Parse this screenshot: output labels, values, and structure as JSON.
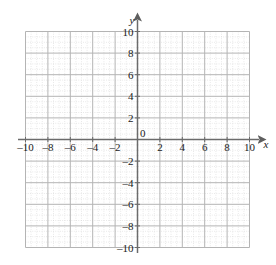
{
  "figure": {
    "kind": "cartesian-coordinate-grid",
    "background_color": "#ffffff"
  },
  "chart_data": {
    "type": "scatter",
    "title": "",
    "subtitle": "",
    "xlabel": "x",
    "ylabel": "y",
    "xlim": [
      -10,
      10
    ],
    "ylim": [
      -10,
      10
    ],
    "x_tick_labels": [
      "-10",
      "-8",
      "-6",
      "-4",
      "-2",
      "0",
      "2",
      "4",
      "6",
      "8",
      "10"
    ],
    "x_tick_values": [
      -10,
      -8,
      -6,
      -4,
      -2,
      0,
      2,
      4,
      6,
      8,
      10
    ],
    "y_tick_labels": [
      "10",
      "8",
      "6",
      "4",
      "2",
      "-2",
      "-4",
      "-6",
      "-8",
      "-10"
    ],
    "y_tick_values": [
      10,
      8,
      6,
      4,
      2,
      -2,
      -4,
      -6,
      -8,
      -10
    ],
    "origin_label": "0",
    "major_tick_step": 2,
    "minor_tick_step": 0.5,
    "grid": true,
    "minor_grid": true,
    "legend": null,
    "series": [],
    "annotations": [],
    "axis_arrows": {
      "x_positive": true,
      "y_positive": true
    },
    "colors": {
      "major_grid": "#b8b8b8",
      "minor_grid": "#cfcfcf",
      "axis": "#6b6b6b",
      "text": "#1a1a1a",
      "background": "#ffffff"
    }
  },
  "axis_labels": {
    "x_axis_name": "x",
    "y_axis_name": "y"
  }
}
